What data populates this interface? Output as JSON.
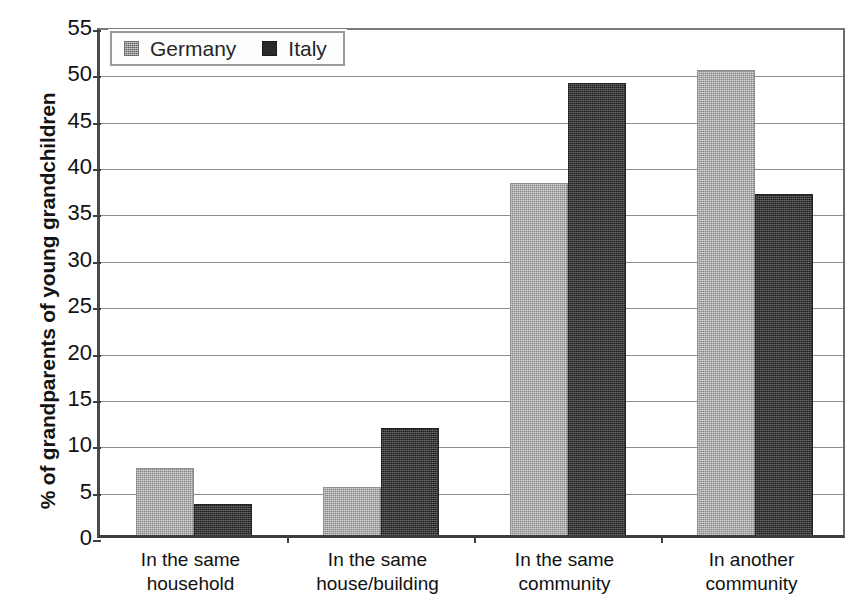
{
  "chart_data": {
    "type": "bar",
    "title": "",
    "subtitle": "",
    "xlabel": "",
    "ylabel": "% of grandparents of young grandchildren",
    "categories": [
      "In the same household",
      "In the same house/building",
      "In the same community",
      "In another community"
    ],
    "category_lines": [
      [
        "In the same",
        "household"
      ],
      [
        "In the same",
        "house/building"
      ],
      [
        "In the same",
        "community"
      ],
      [
        "In another",
        "community"
      ]
    ],
    "series": [
      {
        "name": "Germany",
        "color": "#ababab",
        "values": [
          7.2,
          5.2,
          38.0,
          50.2
        ]
      },
      {
        "name": "Italy",
        "color": "#333333",
        "values": [
          3.3,
          11.5,
          48.8,
          36.8
        ]
      }
    ],
    "ylim": [
      0,
      55
    ],
    "ytick_step": 5,
    "yticks": [
      0,
      5,
      10,
      15,
      20,
      25,
      30,
      35,
      40,
      45,
      50,
      55
    ],
    "ytick_labels": [
      "0",
      "5",
      "10",
      "15",
      "20",
      "25",
      "30",
      "35",
      "40",
      "45",
      "50",
      "55"
    ],
    "grid": true,
    "grid_axis": "y",
    "legend_position": "top-left"
  },
  "legend": {
    "entries": [
      {
        "label": "Germany",
        "swatch": "germany-swatch-icon"
      },
      {
        "label": "Italy",
        "swatch": "italy-swatch-icon"
      }
    ]
  }
}
